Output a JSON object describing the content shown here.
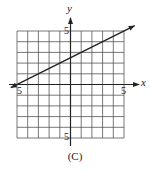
{
  "chart_data": {
    "type": "line",
    "title": "",
    "caption": "(C)",
    "xlabel": "x",
    "ylabel": "y",
    "xlim": [
      -5,
      5
    ],
    "ylim": [
      -5,
      5
    ],
    "grid": true,
    "grid_step": 1,
    "tick_labels": {
      "x_left": "-5",
      "x_right": "5",
      "y_top": "5",
      "y_bottom": "-5"
    },
    "series": [
      {
        "name": "line",
        "equation": "y = 0.5x + 2.5",
        "x": [
          -5,
          0,
          5,
          6
        ],
        "y": [
          0,
          2.5,
          5,
          5.5
        ],
        "arrows": "both",
        "color": "#222222"
      }
    ],
    "legend": "none"
  },
  "labels": {
    "y_axis_name": "y",
    "x_axis_name": "x",
    "y_tick_top": "5",
    "y_tick_bottom": "5",
    "x_tick_left": "5",
    "x_tick_right": "5",
    "caption": "(C)"
  }
}
